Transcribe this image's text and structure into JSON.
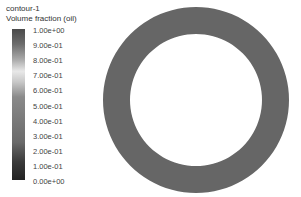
{
  "chart_data": {
    "type": "heatmap",
    "title": "contour-1",
    "subtitle": "Volume fraction (oil)",
    "colorbar": {
      "ticks": [
        "1.00e+00",
        "9.00e-01",
        "8.00e-01",
        "7.00e-01",
        "6.00e-01",
        "5.00e-01",
        "4.00e-01",
        "3.00e-01",
        "2.00e-01",
        "1.00e-01",
        "0.00e+00"
      ],
      "range": [
        0,
        1
      ]
    },
    "geometry": {
      "shape": "annulus",
      "fill_color": "#666666",
      "approx_value": 1.0
    }
  }
}
